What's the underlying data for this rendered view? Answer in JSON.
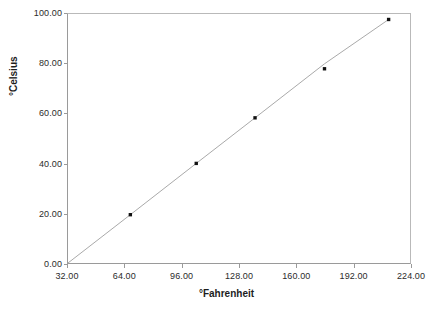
{
  "chart_data": {
    "type": "line",
    "title": "",
    "subtitle": "",
    "xlabel": "°Fahrenheit",
    "ylabel": "°Celsius",
    "xlim": [
      32,
      224
    ],
    "ylim": [
      0,
      100
    ],
    "grid": false,
    "legend": "none",
    "line_color": "#a8a8a8",
    "marker_color": "#111111",
    "marker_style": "square",
    "x_ticks": [
      32,
      64,
      96,
      128,
      160,
      192,
      224
    ],
    "y_ticks": [
      0,
      20,
      40,
      60,
      80,
      100
    ],
    "x_tick_labels": [
      "32.00",
      "64.00",
      "96.00",
      "128.00",
      "160.00",
      "192.00",
      "224.00"
    ],
    "y_tick_labels": [
      "0.00",
      "20.00",
      "40.00",
      "60.00",
      "80.00",
      "100.00"
    ],
    "series": [
      {
        "name": "Celsius vs Fahrenheit",
        "x": [
          32,
          67,
          104,
          137,
          176,
          212
        ],
        "values": [
          0.0,
          19.4,
          40.0,
          58.3,
          80.0,
          97.8
        ],
        "points": [
          {
            "x": 67,
            "y": 19.4
          },
          {
            "x": 104,
            "y": 40.0
          },
          {
            "x": 137,
            "y": 58.3
          },
          {
            "x": 176,
            "y": 78.0
          },
          {
            "x": 212,
            "y": 97.8
          }
        ]
      }
    ],
    "annotations": []
  },
  "axes": {
    "x_title": "°Fahrenheit",
    "y_title": "°Celsius"
  }
}
